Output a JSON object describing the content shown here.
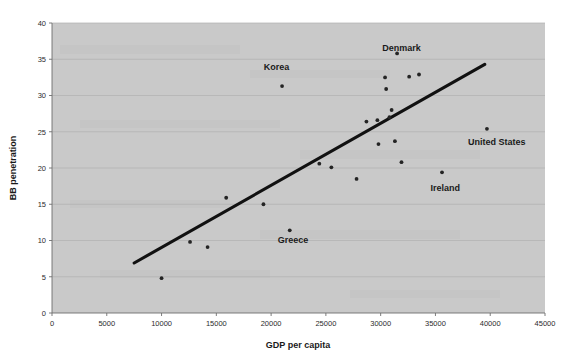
{
  "chart_data": {
    "type": "scatter",
    "title": "",
    "xlabel": "GDP per capita",
    "ylabel": "BB penetration",
    "xlim": [
      0,
      45000
    ],
    "ylim": [
      0,
      40
    ],
    "xticks": [
      0,
      5000,
      10000,
      15000,
      20000,
      25000,
      30000,
      35000,
      40000,
      45000
    ],
    "xtick_labels": [
      "0",
      "5000",
      "10000",
      "15000",
      "20000",
      "25000",
      "30000",
      "35000",
      "40000",
      "45000"
    ],
    "yticks": [
      0,
      5,
      10,
      15,
      20,
      25,
      30,
      35,
      40
    ],
    "ytick_labels": [
      "0",
      "5",
      "10",
      "15",
      "20",
      "25",
      "30",
      "35",
      "40"
    ],
    "grid": true,
    "grid_axis": "y",
    "legend": false,
    "plot_background": "#c9c9c9",
    "marker_color": "#242424",
    "trendline_color": "#111111",
    "points": [
      {
        "x": 10000,
        "y": 4.8,
        "label": ""
      },
      {
        "x": 12600,
        "y": 9.8,
        "label": ""
      },
      {
        "x": 14200,
        "y": 9.1,
        "label": ""
      },
      {
        "x": 15900,
        "y": 15.9,
        "label": ""
      },
      {
        "x": 19300,
        "y": 15.0,
        "label": ""
      },
      {
        "x": 21000,
        "y": 31.3,
        "label": "Korea"
      },
      {
        "x": 21700,
        "y": 11.4,
        "label": "Greece"
      },
      {
        "x": 24400,
        "y": 20.6,
        "label": ""
      },
      {
        "x": 25500,
        "y": 20.1,
        "label": ""
      },
      {
        "x": 27800,
        "y": 18.5,
        "label": ""
      },
      {
        "x": 28700,
        "y": 26.4,
        "label": ""
      },
      {
        "x": 29700,
        "y": 26.6,
        "label": ""
      },
      {
        "x": 29800,
        "y": 23.3,
        "label": ""
      },
      {
        "x": 30400,
        "y": 32.5,
        "label": ""
      },
      {
        "x": 30500,
        "y": 30.9,
        "label": ""
      },
      {
        "x": 30800,
        "y": 27.0,
        "label": ""
      },
      {
        "x": 31000,
        "y": 28.0,
        "label": ""
      },
      {
        "x": 31300,
        "y": 23.7,
        "label": ""
      },
      {
        "x": 31500,
        "y": 35.8,
        "label": "Denmark"
      },
      {
        "x": 31900,
        "y": 20.8,
        "label": ""
      },
      {
        "x": 32600,
        "y": 32.6,
        "label": ""
      },
      {
        "x": 33500,
        "y": 32.9,
        "label": ""
      },
      {
        "x": 35600,
        "y": 19.4,
        "label": "Ireland"
      },
      {
        "x": 39700,
        "y": 25.4,
        "label": "United States"
      }
    ],
    "annotations": [
      {
        "text": "Korea",
        "x": 20500,
        "y": 33.5,
        "anchor": "middle"
      },
      {
        "text": "Denmark",
        "x": 31900,
        "y": 36.2,
        "anchor": "middle"
      },
      {
        "text": "Greece",
        "x": 22000,
        "y": 9.6,
        "anchor": "middle"
      },
      {
        "text": "Ireland",
        "x": 35900,
        "y": 16.8,
        "anchor": "middle"
      },
      {
        "text": "United States",
        "x": 40600,
        "y": 23.2,
        "anchor": "middle"
      }
    ],
    "trendline": {
      "x0": 7500,
      "y0": 6.9,
      "x1": 39500,
      "y1": 34.3
    }
  }
}
